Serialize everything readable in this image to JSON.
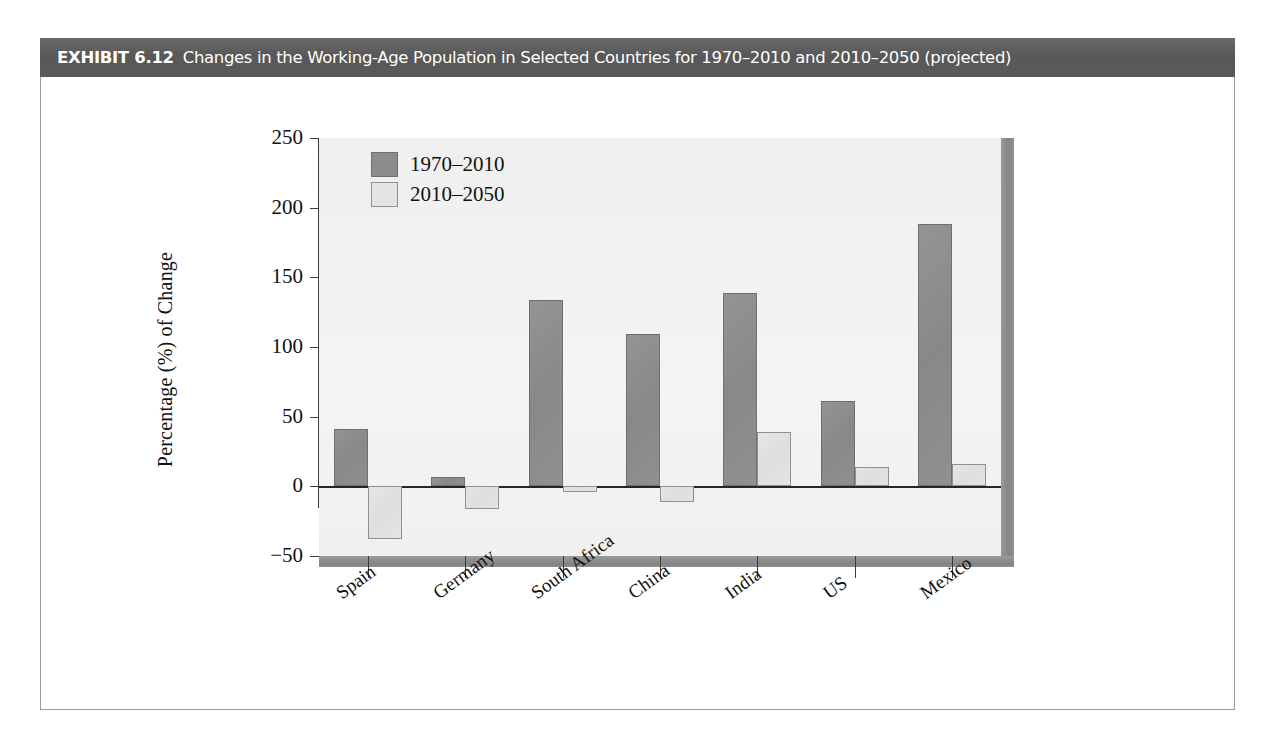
{
  "exhibit": {
    "label": "EXHIBIT 6.12",
    "caption": "Changes in the Working-Age Population in Selected Countries for 1970–2010 and 2010–2050 (projected)"
  },
  "chart_data": {
    "type": "bar",
    "title": "Changes in the Working-Age Population in Selected Countries for 1970–2010 and 2010–2050 (projected)",
    "xlabel": "",
    "ylabel": "Percentage (%) of Change",
    "ylim": [
      -50,
      250
    ],
    "yticks": [
      250,
      200,
      150,
      100,
      50,
      0,
      -50
    ],
    "ytick_labels": [
      "250",
      "200",
      "150",
      "100",
      "50",
      "0",
      "−50"
    ],
    "grid": false,
    "legend_position": "top-left",
    "categories": [
      "Spain",
      "Germany",
      "South Africa",
      "China",
      "India",
      "US",
      "Mexico"
    ],
    "series": [
      {
        "name": "1970–2010",
        "color": "#8d8d8d",
        "values": [
          41,
          7,
          134,
          109,
          139,
          61,
          188
        ]
      },
      {
        "name": "2010–2050",
        "color": "#e4e4e4",
        "values": [
          -38,
          -16,
          -4,
          -11,
          39,
          14,
          16
        ]
      }
    ]
  }
}
